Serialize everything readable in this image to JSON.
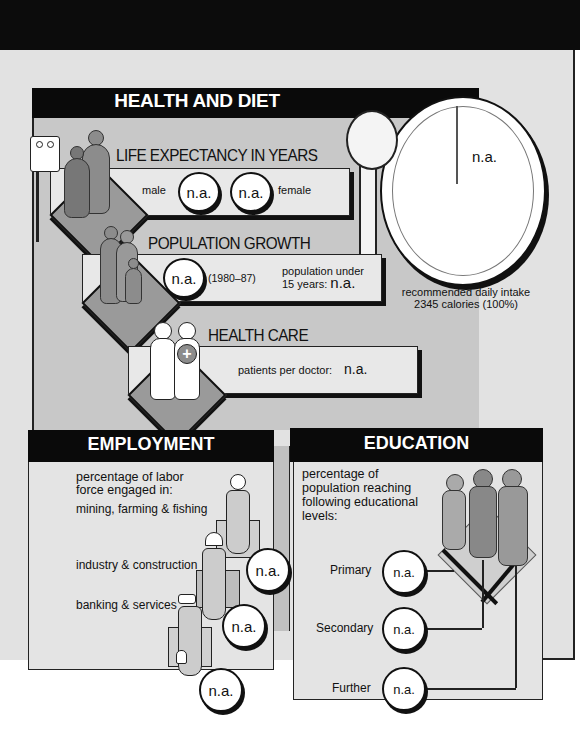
{
  "health_and_diet": {
    "title": "HEALTH AND DIET",
    "life_expectancy": {
      "label": "LIFE EXPECTANCY IN YEARS",
      "male_label": "male",
      "male_value": "n.a.",
      "female_value": "n.a.",
      "female_label": "female"
    },
    "population_growth": {
      "label": "POPULATION GROWTH",
      "value": "n.a.",
      "period": "(1980–87)",
      "under15_label_line1": "population under",
      "under15_label_line2": "15 years:",
      "under15_value": "n.a."
    },
    "health_care": {
      "label": "HEALTH CARE",
      "patients_label": "patients per doctor:",
      "patients_value": "n.a."
    },
    "diet": {
      "plate_value": "n.a.",
      "caption_line1": "recommended daily intake",
      "caption_line2": "2345 calories (100%)"
    }
  },
  "employment": {
    "title": "EMPLOYMENT",
    "intro_line1": "percentage of labor",
    "intro_line2": "force engaged in:",
    "sectors": [
      {
        "label": "mining, farming & fishing",
        "value": "n.a."
      },
      {
        "label": "industry & construction",
        "value": "n.a."
      },
      {
        "label": "banking & services",
        "value": "n.a."
      }
    ]
  },
  "education": {
    "title": "EDUCATION",
    "intro_line1": "percentage of",
    "intro_line2": "population reaching",
    "intro_line3": "following educational",
    "intro_line4": "levels:",
    "levels": [
      {
        "label": "Primary",
        "value": "n.a."
      },
      {
        "label": "Secondary",
        "value": "n.a."
      },
      {
        "label": "Further",
        "value": "n.a."
      }
    ]
  },
  "colors": {
    "header_black": "#0a0a0a",
    "panel_grey": "#c8c8c8",
    "light_grey": "#e4e4e4",
    "figure_grey": "#8c8c8c"
  }
}
